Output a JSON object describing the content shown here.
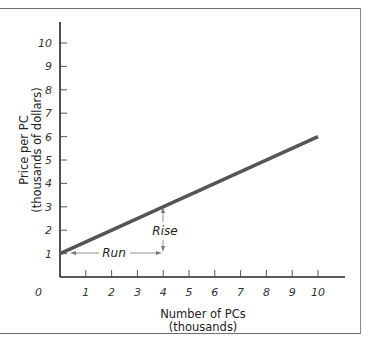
{
  "chart_data": {
    "type": "line",
    "title": "",
    "xlabel": "Number of PCs (thousands)",
    "xlabel_lines": [
      "Number of PCs",
      "(thousands)"
    ],
    "ylabel": "Price per PC (thousands of dollars)",
    "ylabel_lines": [
      "Price per PC",
      "(thousands of dollars)"
    ],
    "xlim": [
      0,
      11
    ],
    "ylim": [
      0,
      11
    ],
    "x_ticks": [
      0,
      1,
      2,
      3,
      4,
      5,
      6,
      7,
      8,
      9,
      10
    ],
    "y_ticks": [
      1,
      2,
      3,
      4,
      5,
      6,
      7,
      8,
      9,
      10
    ],
    "grid": false,
    "legend": null,
    "series": [
      {
        "name": "Price line",
        "x": [
          0,
          10
        ],
        "y": [
          1,
          6
        ],
        "color": "#555555"
      }
    ],
    "annotations": [
      {
        "text": "Run",
        "type": "horizontal-arrow",
        "from": [
          0,
          1
        ],
        "to": [
          4,
          1
        ]
      },
      {
        "text": "Rise",
        "type": "vertical-arrow",
        "from": [
          4,
          1
        ],
        "to": [
          4,
          3
        ]
      }
    ]
  },
  "labels": {
    "origin": "0",
    "x_tick_labels": [
      "1",
      "2",
      "3",
      "4",
      "5",
      "6",
      "7",
      "8",
      "9",
      "10"
    ],
    "y_tick_labels": [
      "1",
      "2",
      "3",
      "4",
      "5",
      "6",
      "7",
      "8",
      "9",
      "10"
    ],
    "xlabel_line1": "Number of PCs",
    "xlabel_line2": "(thousands)",
    "ylabel_line1": "Price per PC",
    "ylabel_line2": "(thousands of dollars)",
    "run": "Run",
    "rise": "Rise"
  }
}
